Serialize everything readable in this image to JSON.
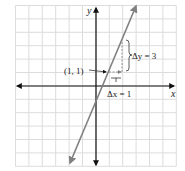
{
  "chart_data": {
    "type": "line",
    "title": "",
    "xlabel": "x",
    "ylabel": "y",
    "xlim": [
      -6,
      6
    ],
    "ylim": [
      -6,
      6
    ],
    "grid": true,
    "series": [
      {
        "name": "y = 3x - 2",
        "x": [
          -1.3,
          3.3
        ],
        "y": [
          -5.9,
          7.9
        ]
      }
    ],
    "annotations": [
      {
        "text": "(1, 1)",
        "point": [
          1,
          1
        ]
      },
      {
        "text": "Δy = 3",
        "from": [
          2,
          1
        ],
        "to": [
          2,
          4
        ]
      },
      {
        "text": "Δx = 1",
        "from": [
          1,
          1
        ],
        "to": [
          2,
          1
        ]
      }
    ]
  },
  "labels": {
    "x_axis": "x",
    "y_axis": "y",
    "point": "(1, 1)",
    "delta_y": "Δy = 3",
    "delta_x": "Δx = 1"
  },
  "colors": {
    "grid": "#dcdcdc",
    "axis": "#111111",
    "line": "#808080",
    "dashed": "#909090"
  }
}
